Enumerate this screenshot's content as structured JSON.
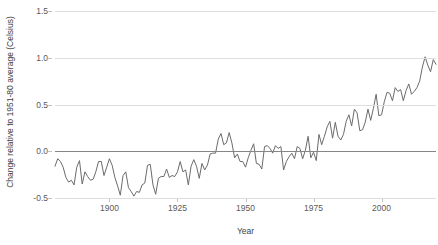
{
  "chart_data": {
    "type": "line",
    "title": "",
    "subtitle": "",
    "xlabel": "Year",
    "ylabel": "Change relative to 1951-80 average (Celsius)",
    "xlim": [
      1880,
      2020
    ],
    "ylim": [
      -0.5,
      1.5
    ],
    "xticks": [
      1900,
      1925,
      1950,
      1975,
      2000
    ],
    "xtick_labels": [
      "1900",
      "1925",
      "1950",
      "1975",
      "2000"
    ],
    "yticks": [
      -0.5,
      0.0,
      0.5,
      1.0,
      1.5
    ],
    "ytick_labels": [
      "-0.5",
      "0.0",
      "0.5",
      "1.0",
      "1.5"
    ],
    "grid": true,
    "grid_axis": "y",
    "legend": false,
    "legend_position": "none",
    "zero_line": 0.0,
    "line_color": "#6b6b6b",
    "grid_color": "#dedede",
    "zero_line_color": "#868686",
    "background_color": "#ffffff",
    "series": [
      {
        "name": "Global mean temperature anomaly",
        "x": [
          1880,
          1881,
          1882,
          1883,
          1884,
          1885,
          1886,
          1887,
          1888,
          1889,
          1890,
          1891,
          1892,
          1893,
          1894,
          1895,
          1896,
          1897,
          1898,
          1899,
          1900,
          1901,
          1902,
          1903,
          1904,
          1905,
          1906,
          1907,
          1908,
          1909,
          1910,
          1911,
          1912,
          1913,
          1914,
          1915,
          1916,
          1917,
          1918,
          1919,
          1920,
          1921,
          1922,
          1923,
          1924,
          1925,
          1926,
          1927,
          1928,
          1929,
          1930,
          1931,
          1932,
          1933,
          1934,
          1935,
          1936,
          1937,
          1938,
          1939,
          1940,
          1941,
          1942,
          1943,
          1944,
          1945,
          1946,
          1947,
          1948,
          1949,
          1950,
          1951,
          1952,
          1953,
          1954,
          1955,
          1956,
          1957,
          1958,
          1959,
          1960,
          1961,
          1962,
          1963,
          1964,
          1965,
          1966,
          1967,
          1968,
          1969,
          1970,
          1971,
          1972,
          1973,
          1974,
          1975,
          1976,
          1977,
          1978,
          1979,
          1980,
          1981,
          1982,
          1983,
          1984,
          1985,
          1986,
          1987,
          1988,
          1989,
          1990,
          1991,
          1992,
          1993,
          1994,
          1995,
          1996,
          1997,
          1998,
          1999,
          2000,
          2001,
          2002,
          2003,
          2004,
          2005,
          2006,
          2007,
          2008,
          2009,
          2010,
          2011,
          2012,
          2013,
          2014,
          2015,
          2016,
          2017,
          2018,
          2019,
          2020
        ],
        "values": [
          -0.16,
          -0.08,
          -0.11,
          -0.17,
          -0.28,
          -0.33,
          -0.31,
          -0.36,
          -0.17,
          -0.1,
          -0.35,
          -0.22,
          -0.27,
          -0.31,
          -0.3,
          -0.22,
          -0.11,
          -0.11,
          -0.26,
          -0.17,
          -0.08,
          -0.15,
          -0.28,
          -0.37,
          -0.47,
          -0.26,
          -0.22,
          -0.39,
          -0.43,
          -0.48,
          -0.43,
          -0.44,
          -0.36,
          -0.34,
          -0.15,
          -0.14,
          -0.36,
          -0.46,
          -0.29,
          -0.27,
          -0.27,
          -0.19,
          -0.28,
          -0.26,
          -0.27,
          -0.22,
          -0.11,
          -0.22,
          -0.2,
          -0.36,
          -0.16,
          -0.09,
          -0.16,
          -0.29,
          -0.13,
          -0.2,
          -0.15,
          -0.03,
          -0.02,
          -0.02,
          0.13,
          0.19,
          0.07,
          0.09,
          0.2,
          0.09,
          -0.07,
          -0.03,
          -0.11,
          -0.11,
          -0.17,
          -0.07,
          0.01,
          0.08,
          -0.13,
          -0.14,
          -0.19,
          0.05,
          0.06,
          0.03,
          -0.02,
          0.06,
          0.03,
          0.05,
          -0.2,
          -0.11,
          -0.06,
          -0.02,
          -0.08,
          0.05,
          0.03,
          -0.08,
          0.01,
          0.16,
          -0.07,
          -0.01,
          -0.1,
          0.18,
          0.07,
          0.16,
          0.26,
          0.32,
          0.14,
          0.31,
          0.16,
          0.12,
          0.18,
          0.32,
          0.39,
          0.27,
          0.45,
          0.41,
          0.22,
          0.23,
          0.31,
          0.45,
          0.33,
          0.46,
          0.61,
          0.38,
          0.39,
          0.53,
          0.63,
          0.62,
          0.54,
          0.68,
          0.64,
          0.66,
          0.54,
          0.65,
          0.72,
          0.61,
          0.64,
          0.68,
          0.75,
          0.9,
          1.01,
          0.92,
          0.85,
          0.98,
          0.93
        ]
      }
    ]
  },
  "axes": {
    "y_title": "Change relative to 1951-80 average (Celsius)",
    "x_title": "Year"
  }
}
